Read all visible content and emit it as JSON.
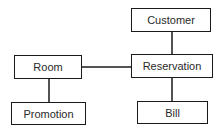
{
  "diagram": {
    "type": "entity-relationship",
    "nodes": [
      {
        "id": "customer",
        "label": "Customer"
      },
      {
        "id": "room",
        "label": "Room"
      },
      {
        "id": "reservation",
        "label": "Reservation"
      },
      {
        "id": "promotion",
        "label": "Promotion"
      },
      {
        "id": "bill",
        "label": "Bill"
      }
    ],
    "edges": [
      {
        "from": "customer",
        "to": "reservation"
      },
      {
        "from": "room",
        "to": "reservation"
      },
      {
        "from": "room",
        "to": "promotion"
      },
      {
        "from": "reservation",
        "to": "bill"
      }
    ],
    "colors": {
      "stroke": "#1a1a1a",
      "text": "#2a2a2a",
      "background": "#ffffff"
    }
  }
}
